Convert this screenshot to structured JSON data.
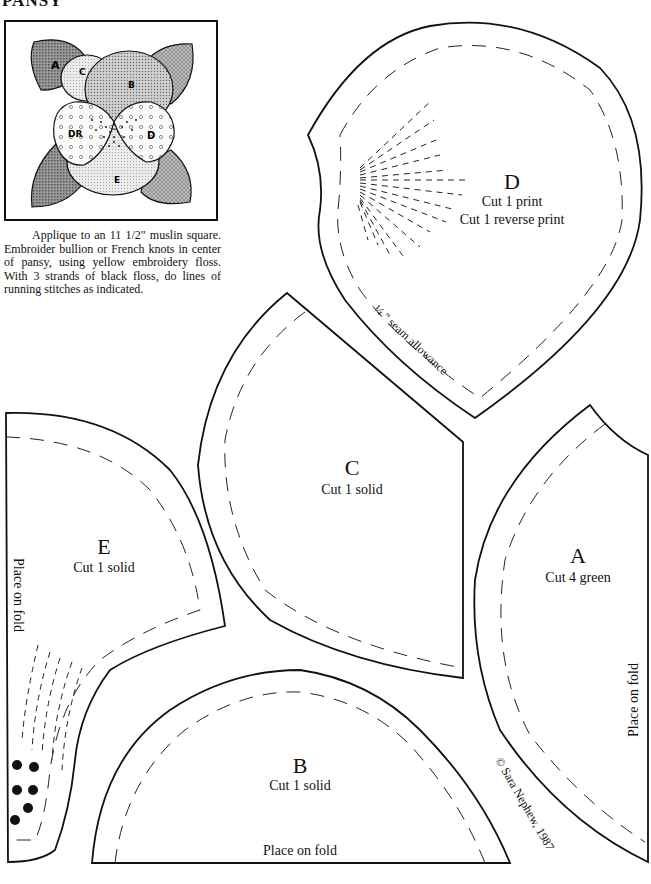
{
  "page": {
    "title": "PANSY"
  },
  "preview": {
    "labels": [
      "A",
      "C",
      "B",
      "DR",
      "D",
      "E"
    ]
  },
  "instructions": {
    "text": "Applique to an 11 1/2\" muslin square. Embroider bullion or French knots in center of pansy, using yellow embroidery floss. With 3 strands of black floss, do lines of running stitches as indicated."
  },
  "pieces": {
    "d": {
      "letter": "D",
      "line1": "Cut 1 print",
      "line2": "Cut 1 reverse print",
      "seam_note": "¼ \" seam allowance"
    },
    "c": {
      "letter": "C",
      "line1": "Cut 1 solid"
    },
    "e": {
      "letter": "E",
      "line1": "Cut 1 solid",
      "fold": "Place on fold"
    },
    "a": {
      "letter": "A",
      "line1": "Cut 4 green",
      "fold": "Place on fold"
    },
    "b": {
      "letter": "B",
      "line1": "Cut 1 solid",
      "fold": "Place on fold"
    }
  },
  "copyright": "© Sara Nephew, 1987",
  "colors": {
    "ink": "#111111",
    "paper": "#ffffff",
    "leaf_dark": "#7a7a7a",
    "petal_light": "#e6e6e6",
    "petal_mid": "#c8c8c8"
  }
}
